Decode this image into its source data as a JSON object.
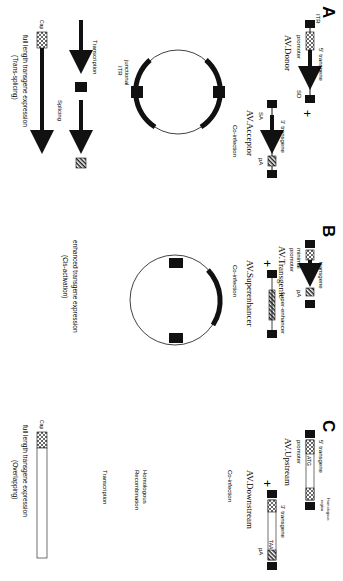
{
  "panels": {
    "A": {
      "letter": "A",
      "donor_name": "AV.Donor",
      "acceptor_name": "AV.Acceptor",
      "labels": {
        "itr": "ITR",
        "five_prime": "5' transgene",
        "promoter": "promoter",
        "sd": "SD",
        "three_prime": "3' transgene",
        "sa": "SA",
        "pa": "pA",
        "plus": "+"
      },
      "steps": [
        "Co-infection",
        "Transcription",
        "Splicing"
      ],
      "junction_label_1": "junctional",
      "junction_label_2": "ITR",
      "cap": "Cap",
      "result_1": "full length transgene expression",
      "result_2": "(Trans-splicing)"
    },
    "B": {
      "letter": "B",
      "transgenic_name": "AV.Transgenic",
      "superenhancer_name": "AV.Superenhancer",
      "labels": {
        "transgene": "transgene",
        "minimal": "minimal",
        "promoter": "promoter",
        "pa": "pA",
        "super_enhancer": "super-enhancer",
        "plus": "+"
      },
      "steps": [
        "Co-infection"
      ],
      "result_1": "enhanced transgene expression",
      "result_2": "(Cis-activation)"
    },
    "C": {
      "letter": "C",
      "upstream_name": "AV.Upstream",
      "downstream_name": "AV.Downstream",
      "labels": {
        "homologous_region_1": "Homologous",
        "homologous_region_2": "region",
        "five_prime": "5' transgene",
        "promoter": "promoter",
        "three_prime": "3' transgene",
        "pa": "pA",
        "atg": "ATG",
        "taa": "TAA",
        "plus": "+"
      },
      "steps": [
        "Co-infection",
        "Homologous",
        "Recombination",
        "Transcription"
      ],
      "cap": "Cap",
      "result_1": "full length transgene expression",
      "result_2": "(Overlapping)"
    }
  }
}
